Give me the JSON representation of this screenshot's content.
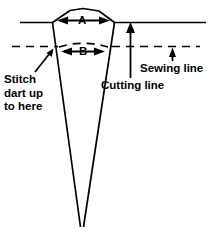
{
  "figure": {
    "type": "sewing-pattern-diagram",
    "background_color": "#ffffff",
    "stroke_color": "#000000"
  },
  "dimensions": {
    "a": {
      "label": "A",
      "name": "dart-width-at-cutting-line",
      "arrow_style": "double-headed-horizontal"
    },
    "b": {
      "label": "B",
      "name": "dart-width-at-sewing-line",
      "arrow_style": "double-headed-horizontal"
    }
  },
  "annotations": {
    "stitch_note": {
      "lines": [
        "Stitch",
        "dart up",
        "to here"
      ],
      "line1": "Stitch",
      "line2": "dart up",
      "line3": "to here",
      "pointer": "diagonal-arrow-up-right"
    },
    "cutting_line": {
      "label": "Cutting line",
      "pointer": "vertical-arrow-up",
      "line_style": "solid"
    },
    "sewing_line": {
      "label": "Sewing line",
      "pointer": "short-vertical-arrow-up",
      "line_style": "dashed"
    }
  },
  "lines": {
    "cutting_line_style": "solid",
    "sewing_line_style": "dashed",
    "dart_outline_style": "solid"
  }
}
